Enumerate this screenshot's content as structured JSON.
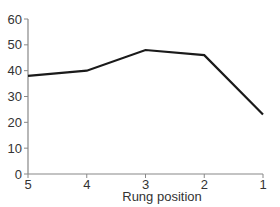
{
  "chart_data": {
    "type": "line",
    "title": "",
    "xlabel": "Rung position",
    "ylabel": "",
    "categories": [
      "5",
      "4",
      "3",
      "2",
      "1"
    ],
    "x": [
      5,
      4,
      3,
      2,
      1
    ],
    "values": [
      38,
      40,
      48,
      46,
      23
    ],
    "series": [
      {
        "name": "",
        "values": [
          38,
          40,
          48,
          46,
          23
        ]
      }
    ],
    "ylim": [
      0,
      60
    ],
    "yticks": [
      0,
      10,
      20,
      30,
      40,
      50,
      60
    ],
    "xticks": [
      "5",
      "4",
      "3",
      "2",
      "1"
    ],
    "x_reversed": true,
    "grid": false,
    "legend": "none"
  },
  "colors": {
    "line": "#1a1a1a",
    "axis": "#888888",
    "text": "#333333"
  }
}
